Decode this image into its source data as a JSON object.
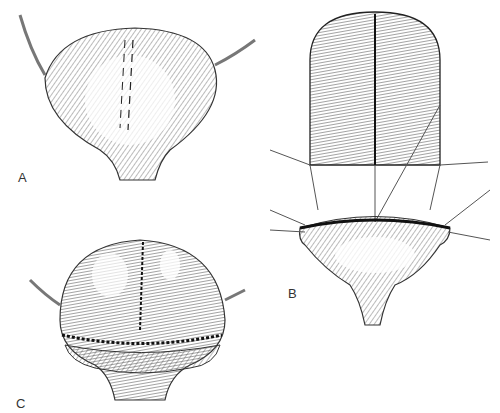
{
  "figure": {
    "panels": [
      {
        "label": "A",
        "description": "Bladder viewed from the front, with a dashed line marking the planned incision on the dome"
      },
      {
        "label": "B",
        "description": "Bladder dome opened and everted, with stay sutures holding the cut edges apart"
      },
      {
        "label": "C",
        "description": "Bladder after augmentation, showing the patch sutured in place"
      }
    ]
  }
}
